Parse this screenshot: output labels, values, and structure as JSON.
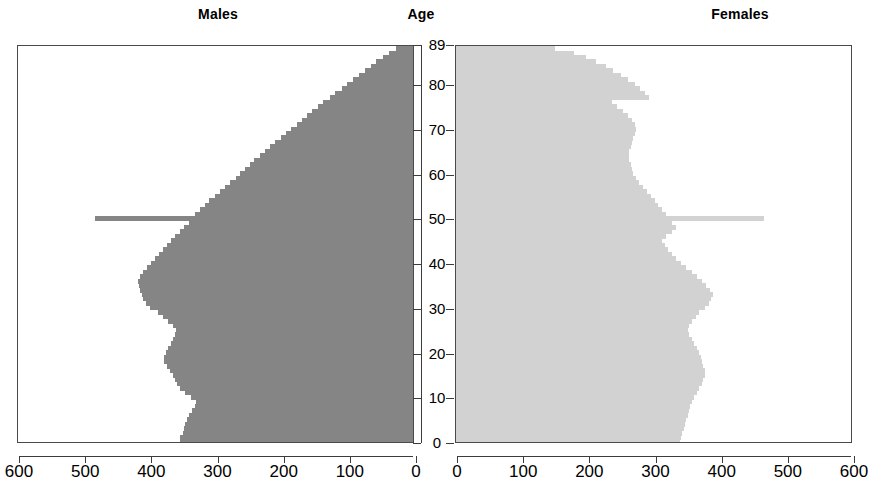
{
  "titles": {
    "males": "Males",
    "age": "Age",
    "females": "Females"
  },
  "chart_data": {
    "type": "bar",
    "subtype": "population-pyramid",
    "title": "",
    "xlabel": "",
    "ylabel": "Age",
    "orientation": "horizontal",
    "grid": false,
    "legend": null,
    "age_axis": {
      "label": "Age",
      "ticks": [
        0,
        10,
        20,
        30,
        40,
        50,
        60,
        70,
        80,
        89
      ],
      "tick_labels": [
        "0",
        "10",
        "20",
        "30",
        "40",
        "50",
        "60",
        "70",
        "80",
        "89"
      ],
      "range": [
        0,
        89
      ],
      "direction": "bottom-to-top"
    },
    "x_axis_left": {
      "name": "Males",
      "tick_labels": [
        "600",
        "500",
        "400",
        "300",
        "200",
        "100",
        "0"
      ],
      "ticks": [
        600,
        500,
        400,
        300,
        200,
        100,
        0
      ],
      "range": [
        600,
        0
      ],
      "direction": "reversed"
    },
    "x_axis_right": {
      "name": "Females",
      "tick_labels": [
        "0",
        "100",
        "200",
        "300",
        "400",
        "500",
        "600"
      ],
      "ticks": [
        0,
        100,
        200,
        300,
        400,
        500,
        600
      ],
      "range": [
        0,
        600
      ],
      "direction": "normal"
    },
    "colors": {
      "males": "#858585",
      "females": "#d2d2d2",
      "axis": "#3c3c3c",
      "background": "#ffffff"
    },
    "series": [
      {
        "name": "Males",
        "side": "left",
        "color": "#858585",
        "ages": [
          0,
          1,
          2,
          3,
          4,
          5,
          6,
          7,
          8,
          9,
          10,
          11,
          12,
          13,
          14,
          15,
          16,
          17,
          18,
          19,
          20,
          21,
          22,
          23,
          24,
          25,
          26,
          27,
          28,
          29,
          30,
          31,
          32,
          33,
          34,
          35,
          36,
          37,
          38,
          39,
          40,
          41,
          42,
          43,
          44,
          45,
          46,
          47,
          48,
          49,
          50,
          51,
          52,
          53,
          54,
          55,
          56,
          57,
          58,
          59,
          60,
          61,
          62,
          63,
          64,
          65,
          66,
          67,
          68,
          69,
          70,
          71,
          72,
          73,
          74,
          75,
          76,
          77,
          78,
          79,
          80,
          81,
          82,
          83,
          84,
          85,
          86,
          87,
          88,
          89
        ],
        "values": [
          352,
          352,
          348,
          346,
          344,
          342,
          338,
          334,
          330,
          328,
          336,
          344,
          352,
          356,
          360,
          362,
          368,
          372,
          376,
          376,
          374,
          370,
          366,
          362,
          360,
          358,
          362,
          370,
          378,
          386,
          398,
          404,
          408,
          410,
          412,
          414,
          416,
          412,
          408,
          402,
          396,
          390,
          384,
          378,
          372,
          366,
          360,
          352,
          346,
          338,
          480,
          330,
          322,
          314,
          308,
          300,
          292,
          284,
          276,
          268,
          262,
          254,
          246,
          240,
          232,
          224,
          216,
          208,
          200,
          192,
          184,
          176,
          168,
          160,
          152,
          144,
          136,
          126,
          118,
          108,
          100,
          90,
          82,
          72,
          64,
          56,
          46,
          36,
          26,
          14
        ]
      },
      {
        "name": "Females",
        "side": "right",
        "color": "#d2d2d2",
        "ages": [
          0,
          1,
          2,
          3,
          4,
          5,
          6,
          7,
          8,
          9,
          10,
          11,
          12,
          13,
          14,
          15,
          16,
          17,
          18,
          19,
          20,
          21,
          22,
          23,
          24,
          25,
          26,
          27,
          28,
          29,
          30,
          31,
          32,
          33,
          34,
          35,
          36,
          37,
          38,
          39,
          40,
          41,
          42,
          43,
          44,
          45,
          46,
          47,
          48,
          49,
          50,
          51,
          52,
          53,
          54,
          55,
          56,
          57,
          58,
          59,
          60,
          61,
          62,
          63,
          64,
          65,
          66,
          67,
          68,
          69,
          70,
          71,
          72,
          73,
          74,
          75,
          76,
          77,
          78,
          79,
          80,
          81,
          82,
          83,
          84,
          85,
          86,
          87,
          88,
          89
        ],
        "values": [
          338,
          340,
          342,
          344,
          346,
          348,
          350,
          352,
          354,
          356,
          360,
          364,
          368,
          372,
          374,
          376,
          376,
          374,
          372,
          370,
          368,
          364,
          360,
          356,
          352,
          350,
          352,
          356,
          362,
          368,
          376,
          382,
          386,
          388,
          384,
          378,
          372,
          364,
          356,
          348,
          340,
          332,
          326,
          320,
          316,
          312,
          318,
          326,
          332,
          326,
          465,
          318,
          312,
          306,
          300,
          294,
          288,
          282,
          276,
          272,
          268,
          266,
          264,
          262,
          262,
          262,
          264,
          266,
          268,
          270,
          272,
          270,
          266,
          260,
          252,
          244,
          236,
          292,
          286,
          278,
          270,
          260,
          250,
          238,
          226,
          212,
          196,
          178,
          150,
          120
        ]
      }
    ]
  }
}
